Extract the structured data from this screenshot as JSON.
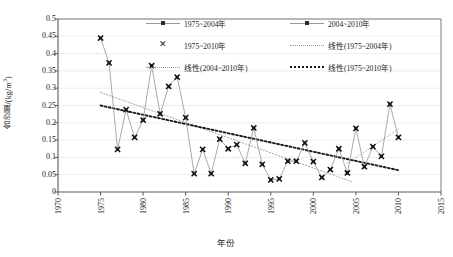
{
  "chart_data": {
    "type": "line",
    "title": "",
    "xlabel": "年份",
    "ylabel": "含沙量/(kg/m³)",
    "xlim": [
      1970,
      2015
    ],
    "ylim": [
      0,
      0.5
    ],
    "xticks": [
      1970,
      1975,
      1980,
      1985,
      1990,
      1995,
      2000,
      2005,
      2010,
      2015
    ],
    "yticks": [
      0,
      0.05,
      0.1,
      0.15,
      0.2,
      0.25,
      0.3,
      0.35,
      0.4,
      0.45,
      0.5
    ],
    "ytick_labels": [
      "0",
      "0.05",
      "0.1",
      "0.15",
      "0.2",
      "0.25",
      "0.3",
      "0.35",
      "0.4",
      "0.45",
      "0.5"
    ],
    "xtick_labels": [
      "1970",
      "1975",
      "1980",
      "1985",
      "1990",
      "1995",
      "2000",
      "2005",
      "2010",
      "2015"
    ],
    "grid": "horizontal",
    "legend_position": "top-inside",
    "x": [
      1975,
      1976,
      1977,
      1978,
      1979,
      1980,
      1981,
      1982,
      1983,
      1984,
      1985,
      1986,
      1987,
      1988,
      1989,
      1990,
      1991,
      1992,
      1993,
      1994,
      1995,
      1996,
      1997,
      1998,
      1999,
      2000,
      2001,
      2002,
      2003,
      2004,
      2005,
      2006,
      2007,
      2008,
      2009,
      2010
    ],
    "series": [
      {
        "name": "1975~2004年",
        "marker": "square-dot",
        "color": "#9a9a9a",
        "x": [
          1975,
          1976,
          1977,
          1978,
          1979,
          1980,
          1981,
          1982,
          1983,
          1984,
          1985,
          1986,
          1987,
          1988,
          1989,
          1990,
          1991,
          1992,
          1993,
          1994,
          1995,
          1996,
          1997,
          1998,
          1999,
          2000,
          2001,
          2002,
          2003,
          2004
        ],
        "values": [
          0.445,
          0.373,
          0.123,
          0.238,
          0.158,
          0.208,
          0.365,
          0.226,
          0.305,
          0.332,
          0.215,
          0.053,
          0.123,
          0.053,
          0.153,
          0.125,
          0.137,
          0.083,
          0.185,
          0.08,
          0.035,
          0.038,
          0.089,
          0.089,
          0.142,
          0.088,
          0.042,
          0.065,
          0.125,
          0.055
        ]
      },
      {
        "name": "2004~2010年",
        "marker": "square-dot",
        "color": "#9a9a9a",
        "x": [
          2004,
          2005,
          2006,
          2007,
          2008,
          2009,
          2010
        ],
        "values": [
          0.055,
          0.184,
          0.073,
          0.131,
          0.103,
          0.254,
          0.158
        ]
      },
      {
        "name": "1975~2010年",
        "marker": "x",
        "color": "#1a1a1a",
        "x": [
          1975,
          1976,
          1977,
          1978,
          1979,
          1980,
          1981,
          1982,
          1983,
          1984,
          1985,
          1986,
          1987,
          1988,
          1989,
          1990,
          1991,
          1992,
          1993,
          1994,
          1995,
          1996,
          1997,
          1998,
          1999,
          2000,
          2001,
          2002,
          2003,
          2004,
          2005,
          2006,
          2007,
          2008,
          2009,
          2010
        ],
        "values": [
          0.445,
          0.373,
          0.123,
          0.238,
          0.158,
          0.208,
          0.365,
          0.226,
          0.305,
          0.332,
          0.215,
          0.053,
          0.123,
          0.053,
          0.153,
          0.125,
          0.137,
          0.083,
          0.185,
          0.08,
          0.035,
          0.038,
          0.089,
          0.089,
          0.142,
          0.088,
          0.042,
          0.065,
          0.125,
          0.055,
          0.184,
          0.073,
          0.131,
          0.103,
          0.254,
          0.158
        ]
      }
    ],
    "trendlines": [
      {
        "name": "线性(1975~2004年)",
        "style": "dotted-thin",
        "color": "#9a9a9a",
        "x0": 1975,
        "y0": 0.288,
        "x1": 2004.5,
        "y1": 0.03
      },
      {
        "name": "线性(2004~2010年)",
        "style": "dotted-thin",
        "color": "#b0b0b0",
        "x0": 2004,
        "y0": 0.083,
        "x1": 2010,
        "y1": 0.182
      },
      {
        "name": "线性(1975~2010年)",
        "style": "dotted-bold",
        "color": "#1a1a1a",
        "x0": 1975,
        "y0": 0.25,
        "x1": 2010,
        "y1": 0.063
      }
    ],
    "legend": [
      {
        "id": "legend-1975-2004",
        "label": "1975~2004年",
        "key": "line-dot"
      },
      {
        "id": "legend-2004-2010",
        "label": "2004~2010年",
        "key": "line-dot"
      },
      {
        "id": "legend-1975-2010",
        "label": "1975~2010年",
        "key": "x-marker"
      },
      {
        "id": "legend-trend-1975-2004",
        "label": "线性(1975~2004年)",
        "key": "dotted-thin"
      },
      {
        "id": "legend-trend-2004-2010",
        "label": "线性(2004~2010年)",
        "key": "dotted-thin"
      },
      {
        "id": "legend-trend-1975-2010",
        "label": "线性(1975~2010年)",
        "key": "dotted-bold"
      }
    ]
  },
  "axes": {
    "ylabel_main": "含沙量/(kg/m",
    "ylabel_sup": "3",
    "ylabel_tail": ")",
    "xlabel": "年份"
  }
}
